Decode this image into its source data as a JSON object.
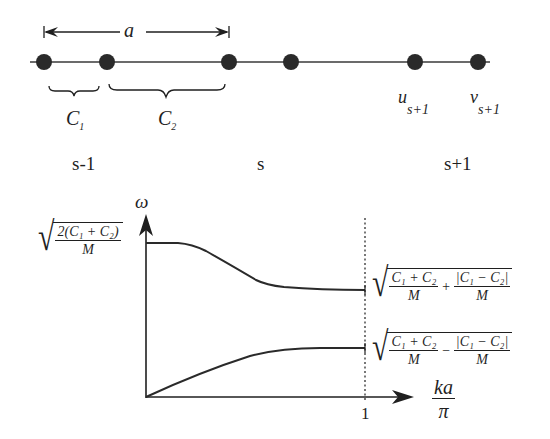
{
  "chain": {
    "spacing_label": "a",
    "spring_labels": [
      "C",
      "C"
    ],
    "spring_subscripts": [
      "1",
      "2"
    ],
    "displacement_labels": [
      {
        "symbol": "u",
        "subscript": "s+1"
      },
      {
        "symbol": "v",
        "subscript": "s+1"
      }
    ],
    "cell_labels": [
      "s-1",
      "s",
      "s+1"
    ],
    "atom_positions_px": [
      44,
      107,
      229,
      291,
      415,
      478
    ]
  },
  "dispersion": {
    "y_axis_label": "ω",
    "x_axis_label_num": "ka",
    "x_axis_label_den": "π",
    "x_tick_label": "1",
    "y_max_label": {
      "num": "2(C₁ + C₂)",
      "den": "M"
    },
    "optical_edge_label": {
      "term1_num": "C₁ + C₂",
      "term1_den": "M",
      "op": "+",
      "term2_num": "|C₁ − C₂|",
      "term2_den": "M"
    },
    "acoustic_edge_label": {
      "term1_num": "C₁ + C₂",
      "term1_den": "M",
      "op": "−",
      "term2_num": "|C₁ − C₂|",
      "term2_den": "M"
    }
  },
  "colors": {
    "ink": "#1f1f1f",
    "atom": "#2a2a2a",
    "background": "#ffffff"
  }
}
